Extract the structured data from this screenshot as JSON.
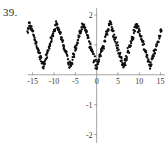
{
  "figure": {
    "problem_number": "39.",
    "point_color": "#111111",
    "axis_color": "#8f8f8f"
  },
  "chart_data": {
    "type": "scatter",
    "title": "",
    "xlabel": "",
    "ylabel": "",
    "xlim": [
      -17.5,
      16.5
    ],
    "ylim": [
      -2.35,
      2.3
    ],
    "xticks": [
      -15,
      -10,
      -5,
      0,
      5,
      10,
      15
    ],
    "xtick_labels": [
      "-15",
      "-10",
      "-5",
      "0",
      "5",
      "10",
      "15"
    ],
    "yticks": [
      2,
      1,
      -1,
      -2
    ],
    "ytick_labels": [
      "2",
      "1",
      "-1",
      "-2"
    ],
    "grid": false,
    "legend": null,
    "origin_label": "0",
    "model": {
      "shape": "triangle-wave",
      "center": 1.0,
      "amplitude": 0.72,
      "period": 6.28,
      "phase_peak_x": 0.0,
      "noise_sigma": 0.12,
      "x_start": -16.2,
      "x_end": 15.2,
      "n_points": 430
    },
    "peaks_x": [
      -12.6,
      -6.3,
      0.0,
      6.3,
      12.6
    ],
    "peaks_y": [
      1.72,
      1.72,
      1.72,
      1.72,
      1.72
    ],
    "troughs_x": [
      -15.7,
      -9.4,
      -3.1,
      3.1,
      9.4
    ],
    "troughs_y": [
      0.28,
      0.28,
      0.28,
      0.28,
      0.28
    ]
  }
}
